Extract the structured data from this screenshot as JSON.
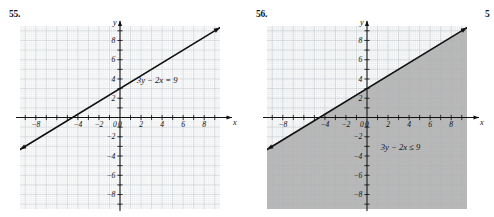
{
  "page": {
    "background": "#ffffff",
    "edge_sliver_text": "5"
  },
  "figures": [
    {
      "number": "55.",
      "equation": "3y − 2x = 9",
      "shaded": false,
      "line_style": "solid",
      "chart_data": {
        "type": "line",
        "title": "",
        "xlabel": "x",
        "ylabel": "y",
        "xlim": [
          -9.5,
          9.5
        ],
        "ylim": [
          -9.5,
          9.5
        ],
        "grid": true,
        "grid_minor_step": 0.2,
        "grid_major_step": 1,
        "tick_step": 1,
        "x_tick_labels": [
          "-8",
          "-4",
          "-2",
          "0",
          "2",
          "4",
          "6",
          "8"
        ],
        "x_tick_values": [
          -8,
          -4,
          -2,
          0,
          2,
          4,
          6,
          8
        ],
        "y_tick_labels": [
          "8",
          "6",
          "4",
          "2",
          "-2",
          "-4",
          "-6",
          "-8"
        ],
        "y_tick_values": [
          8,
          6,
          4,
          2,
          -2,
          -4,
          -6,
          -8
        ],
        "series": [
          {
            "name": "3y - 2x = 9",
            "equation_y": "y = (2/3)x + 3",
            "slope": 0.6667,
            "intercept": 3,
            "x": [
              -9.3,
              9.3
            ],
            "y": [
              -3.2,
              9.2
            ],
            "arrows": "both",
            "color": "#111111"
          }
        ],
        "annotations": [
          {
            "text": "3y − 2x = 9",
            "x": 1.6,
            "y": 3.6
          }
        ],
        "legend": "none"
      }
    },
    {
      "number": "56.",
      "equation": "3y − 2x ≤ 9",
      "shaded": true,
      "shade_color": "#a6a6a6",
      "line_style": "solid",
      "chart_data": {
        "type": "line",
        "title": "",
        "xlabel": "x",
        "ylabel": "y",
        "xlim": [
          -9.5,
          9.5
        ],
        "ylim": [
          -9.5,
          9.5
        ],
        "grid": true,
        "grid_minor_step": 0.2,
        "grid_major_step": 1,
        "tick_step": 1,
        "x_tick_labels": [
          "-8",
          "-4",
          "-2",
          "0",
          "2",
          "4",
          "6",
          "8"
        ],
        "x_tick_values": [
          -8,
          -4,
          -2,
          0,
          2,
          4,
          6,
          8
        ],
        "y_tick_labels": [
          "8",
          "6",
          "4",
          "2",
          "-2",
          "-4",
          "-6",
          "-8"
        ],
        "y_tick_values": [
          8,
          6,
          4,
          2,
          -2,
          -4,
          -6,
          -8
        ],
        "series": [
          {
            "name": "3y - 2x = 9",
            "equation_y": "y = (2/3)x + 3",
            "slope": 0.6667,
            "intercept": 3,
            "x": [
              -9.3,
              9.3
            ],
            "y": [
              -3.2,
              9.2
            ],
            "arrows": "both",
            "color": "#111111"
          }
        ],
        "shading": {
          "region": "below",
          "inequality": "3y - 2x <= 9",
          "fill": "#a6a6a6"
        },
        "annotations": [
          {
            "text": "3y − 2x ≤ 9",
            "x": 1.3,
            "y": -3.4
          }
        ],
        "legend": "none"
      }
    }
  ]
}
